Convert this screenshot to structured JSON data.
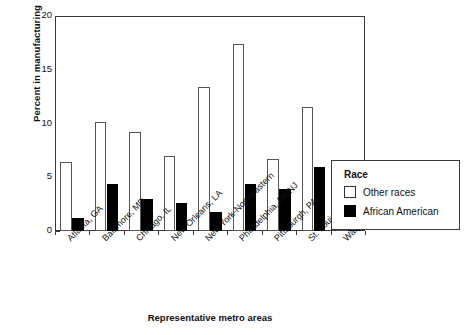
{
  "chart_data": {
    "type": "bar",
    "title": "",
    "xlabel": "Representative metro areas",
    "ylabel": "Percent in manufacturing",
    "ylim": [
      0,
      20
    ],
    "yticks": [
      0,
      5,
      10,
      15,
      20
    ],
    "grid": false,
    "legend_position": "right",
    "legend_title": "Race",
    "categories": [
      "Atlanta, GA",
      "Baltimore, MD",
      "Chicago, IL",
      "New Orleans, LA",
      "New York-Northeastern",
      "Philadelphia, PA/NJ",
      "Pittsburgh, PA",
      "St. Louis, MO-IL",
      "Washington, DC/MD/VA"
    ],
    "series": [
      {
        "name": "Other races",
        "color": "#ffffff",
        "values": [
          6.4,
          10.1,
          9.2,
          7.0,
          13.4,
          17.4,
          6.7,
          11.5,
          4.6
        ]
      },
      {
        "name": "African American",
        "color": "#000000",
        "values": [
          1.2,
          4.4,
          3.0,
          2.6,
          1.8,
          4.4,
          3.9,
          6.0,
          2.0
        ]
      }
    ]
  }
}
